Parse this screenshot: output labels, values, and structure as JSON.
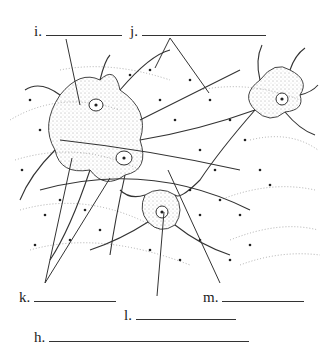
{
  "diagram": {
    "labels": [
      {
        "id": "i",
        "text": "i.",
        "x": 34,
        "y": 23,
        "blank_width": 76
      },
      {
        "id": "j",
        "text": "j.",
        "x": 130,
        "y": 23,
        "blank_width": 124
      },
      {
        "id": "k",
        "text": "k.",
        "x": 19,
        "y": 289,
        "blank_width": 82
      },
      {
        "id": "m",
        "text": "m.",
        "x": 203,
        "y": 289,
        "blank_width": 82
      },
      {
        "id": "l",
        "text": "l.",
        "x": 124,
        "y": 307,
        "blank_width": 100
      },
      {
        "id": "h",
        "text": "h.",
        "x": 34,
        "y": 329,
        "blank_width": 200
      }
    ],
    "leader_lines": [
      {
        "label": "i",
        "x1": 66,
        "y1": 39,
        "x2": 80,
        "y2": 105
      },
      {
        "label": "j",
        "x1": 170,
        "y1": 38,
        "x2": 155,
        "y2": 68
      },
      {
        "label": "j",
        "x1": 170,
        "y1": 38,
        "x2": 209,
        "y2": 93
      },
      {
        "label": "k",
        "x1": 45,
        "y1": 283,
        "x2": 72,
        "y2": 158
      },
      {
        "label": "k",
        "x1": 45,
        "y1": 283,
        "x2": 110,
        "y2": 178
      },
      {
        "label": "l",
        "x1": 157,
        "y1": 296,
        "x2": 164,
        "y2": 212
      },
      {
        "label": "m",
        "x1": 220,
        "y1": 283,
        "x2": 168,
        "y2": 170
      }
    ]
  }
}
